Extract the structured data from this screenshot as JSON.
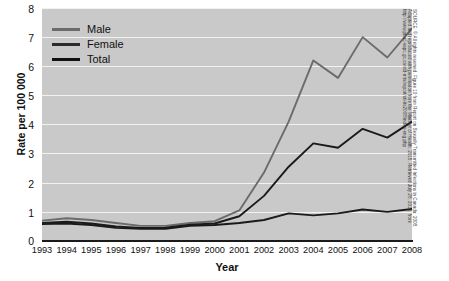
{
  "chart_data": {
    "type": "line",
    "title": "",
    "xlabel": "Year",
    "ylabel": "Rate per 100 000",
    "categories": [
      "1993",
      "1994",
      "1995",
      "1996",
      "1997",
      "1998",
      "1999",
      "2000",
      "2001",
      "2002",
      "2003",
      "2004",
      "2005",
      "2006",
      "2007",
      "2008"
    ],
    "x": [
      1993,
      1994,
      1995,
      1996,
      1997,
      1998,
      1999,
      2000,
      2001,
      2002,
      2003,
      2004,
      2005,
      2006,
      2007,
      2008
    ],
    "series": [
      {
        "name": "Male",
        "color": "#6b6b6b",
        "values": [
          0.7,
          0.78,
          0.72,
          0.62,
          0.52,
          0.52,
          0.62,
          0.68,
          1.05,
          2.35,
          4.1,
          6.2,
          5.6,
          7.0,
          6.3,
          7.3
        ]
      },
      {
        "name": "Female",
        "color": "#1a1a1a",
        "values": [
          0.58,
          0.6,
          0.55,
          0.45,
          0.42,
          0.42,
          0.52,
          0.55,
          0.62,
          0.72,
          0.95,
          0.88,
          0.95,
          1.08,
          1.0,
          1.1
        ]
      },
      {
        "name": "Total",
        "color": "#1a1a1a",
        "values": [
          0.62,
          0.66,
          0.6,
          0.5,
          0.45,
          0.46,
          0.56,
          0.6,
          0.85,
          1.55,
          2.55,
          3.35,
          3.2,
          3.85,
          3.55,
          4.1
        ]
      }
    ],
    "ylim": [
      0,
      8
    ],
    "yticks": [
      0,
      1,
      2,
      3,
      4,
      5,
      6,
      7,
      8
    ],
    "ytick_labels": [
      "0",
      "1",
      "2",
      "3",
      "4",
      "5",
      "6",
      "7",
      "8"
    ],
    "grid": "horizontal",
    "legend_position": "top-left",
    "plot_background": "#c9c9c9",
    "gridline_color": "#f2f2f2"
  },
  "legend": {
    "items": [
      {
        "label": "Male"
      },
      {
        "label": "Female"
      },
      {
        "label": "Total"
      }
    ]
  },
  "source_note": {
    "text": "SOURCE: © All rights reserved. Figure 10 from Report on Sexually Transmitted Infections in Canada: 2008. Adapted and reproduced with permission from the Minister of Health, 2015. Retrieved July 28, 2015, from http://www.phac-aspc.gc.ca/std-mts/report/sti-its2008/index-eng.php"
  }
}
